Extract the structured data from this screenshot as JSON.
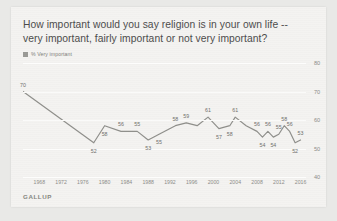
{
  "card": {
    "title": "How important would you say religion is in your own life -- very important, fairly important or not very important?",
    "source": "GALLUP"
  },
  "legend": {
    "label": "% Very important",
    "color": "#9a9a96"
  },
  "colors": {
    "background": "#e9e9e7",
    "card": "#f4f3f1",
    "line": "#8f8f8b",
    "gridline": "#fdfdfc",
    "text": "#4c4c4c",
    "axis_text": "#8c8c88"
  },
  "chart_data": {
    "type": "line",
    "title": "How important would you say religion is in your own life -- very important, fairly important or not very important?",
    "xlabel": "",
    "ylabel": "",
    "ylim": [
      40,
      80
    ],
    "xlim": [
      1965,
      2017
    ],
    "yticks": [
      80,
      70,
      60,
      50,
      40
    ],
    "xticks": [
      1968,
      1972,
      1976,
      1980,
      1984,
      1988,
      1992,
      1996,
      2000,
      2004,
      2008,
      2012,
      2016
    ],
    "grid": true,
    "legend_position": "top-left",
    "series": [
      {
        "name": "% Very important",
        "color": "#8f8f8b",
        "points": [
          {
            "x": 1965,
            "y": 70,
            "label": "70",
            "show_label": true,
            "label_pos": "above"
          },
          {
            "x": 1978,
            "y": 52,
            "label": "52",
            "show_label": true,
            "label_pos": "below"
          },
          {
            "x": 1980,
            "y": 58,
            "label": "58",
            "show_label": true,
            "label_pos": "below"
          },
          {
            "x": 1983,
            "y": 56,
            "label": "56",
            "show_label": true,
            "label_pos": "above"
          },
          {
            "x": 1986,
            "y": 56,
            "label": "55",
            "show_label": true,
            "label_pos": "above"
          },
          {
            "x": 1988,
            "y": 53,
            "label": "53",
            "show_label": true,
            "label_pos": "below"
          },
          {
            "x": 1990,
            "y": 55,
            "label": "55",
            "show_label": true,
            "label_pos": "below"
          },
          {
            "x": 1993,
            "y": 58,
            "label": "58",
            "show_label": true,
            "label_pos": "above"
          },
          {
            "x": 1995,
            "y": 59,
            "label": "59",
            "show_label": true,
            "label_pos": "above"
          },
          {
            "x": 1997,
            "y": 58,
            "label": "",
            "show_label": false,
            "label_pos": "above"
          },
          {
            "x": 1999,
            "y": 61,
            "label": "61",
            "show_label": true,
            "label_pos": "above"
          },
          {
            "x": 2001,
            "y": 57,
            "label": "57",
            "show_label": true,
            "label_pos": "below"
          },
          {
            "x": 2003,
            "y": 58,
            "label": "58",
            "show_label": true,
            "label_pos": "below"
          },
          {
            "x": 2004,
            "y": 61,
            "label": "61",
            "show_label": true,
            "label_pos": "above"
          },
          {
            "x": 2006,
            "y": 58,
            "label": "",
            "show_label": false,
            "label_pos": "above"
          },
          {
            "x": 2008,
            "y": 56,
            "label": "56",
            "show_label": true,
            "label_pos": "above"
          },
          {
            "x": 2009,
            "y": 54,
            "label": "54",
            "show_label": true,
            "label_pos": "below"
          },
          {
            "x": 2010,
            "y": 56,
            "label": "56",
            "show_label": true,
            "label_pos": "above"
          },
          {
            "x": 2011,
            "y": 54,
            "label": "54",
            "show_label": true,
            "label_pos": "below"
          },
          {
            "x": 2012,
            "y": 55,
            "label": "55",
            "show_label": true,
            "label_pos": "above"
          },
          {
            "x": 2013,
            "y": 58,
            "label": "58",
            "show_label": true,
            "label_pos": "above"
          },
          {
            "x": 2014,
            "y": 56,
            "label": "56",
            "show_label": true,
            "label_pos": "above"
          },
          {
            "x": 2015,
            "y": 52,
            "label": "52",
            "show_label": true,
            "label_pos": "below"
          },
          {
            "x": 2016,
            "y": 53,
            "label": "53",
            "show_label": true,
            "label_pos": "above"
          }
        ]
      }
    ]
  }
}
